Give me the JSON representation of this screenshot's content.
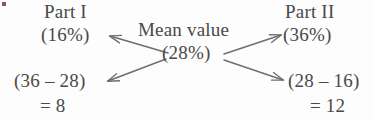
{
  "diagram": {
    "type": "alligation-mean-value",
    "center": {
      "title": "Mean value",
      "value": "(28%)"
    },
    "top_left": {
      "title": "Part I",
      "value": "(16%)"
    },
    "top_right": {
      "title": "Part II",
      "value": "(36%)"
    },
    "bottom_left": {
      "expression": "(36 – 28)",
      "result": "= 8"
    },
    "bottom_right": {
      "expression": "(28 – 16)",
      "result": "= 12"
    },
    "arrows": [
      {
        "name": "arrow-center-to-part1",
        "direction": "up-left"
      },
      {
        "name": "arrow-center-to-part2",
        "direction": "up-right"
      },
      {
        "name": "arrow-center-to-left-result",
        "direction": "down-left"
      },
      {
        "name": "arrow-center-to-right-result",
        "direction": "down-right"
      }
    ],
    "colors": {
      "text": "#494949",
      "arrow": "#6e6e6e",
      "background": "#fdfdfd",
      "speck": "#8d2b4a"
    }
  }
}
